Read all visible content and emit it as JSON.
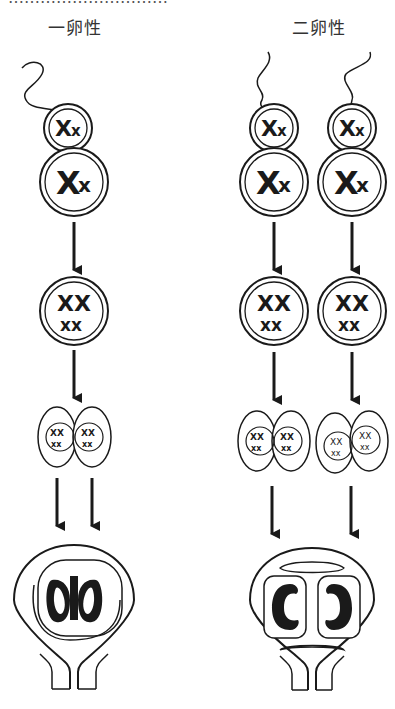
{
  "header": {
    "cropped_text": "…………………………",
    "left_label": "一卵性",
    "right_label": "二卵性"
  },
  "columns": [
    {
      "name": "monozygotic",
      "label": "一卵性",
      "sperm_count": 1,
      "egg_count": 1,
      "outcome": "shared placenta, two embryos"
    },
    {
      "name": "dizygotic",
      "label": "二卵性",
      "sperm_count": 2,
      "egg_count": 2,
      "outcome": "separate sacs, two embryos"
    }
  ],
  "stages": [
    "fertilization",
    "zygote",
    "two-cell division",
    "implantation in uterus"
  ],
  "colors": {
    "ink": "#1a1a1a",
    "background": "#ffffff"
  }
}
